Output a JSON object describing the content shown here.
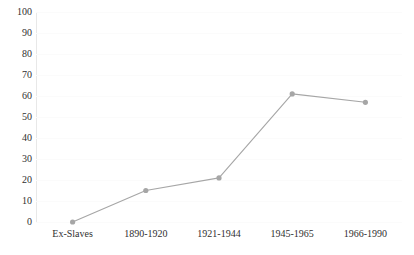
{
  "chart_data": {
    "type": "line",
    "title": "",
    "subtitle": "",
    "xlabel": "",
    "ylabel": "",
    "categories": [
      "Ex-Slaves",
      "1890-1920",
      "1921-1944",
      "1945-1965",
      "1966-1990"
    ],
    "series": [
      {
        "name": "",
        "values": [
          0,
          15,
          21,
          61,
          57
        ]
      }
    ],
    "ylim": [
      0,
      100
    ],
    "y_ticks": [
      0,
      10,
      20,
      30,
      40,
      50,
      60,
      70,
      80,
      90,
      100
    ],
    "y_tick_labels": [
      "0",
      "10",
      "20",
      "30",
      "40",
      "50",
      "60",
      "70",
      "80",
      "90",
      "100"
    ],
    "grid": true,
    "legend": "none",
    "colors": {
      "line": "#a6a6a6",
      "marker": "#a6a6a6",
      "grid": "#fbfbfb",
      "axis": "#e8e8e8",
      "text": "#2f2f2f",
      "background": "#ffffff"
    }
  }
}
